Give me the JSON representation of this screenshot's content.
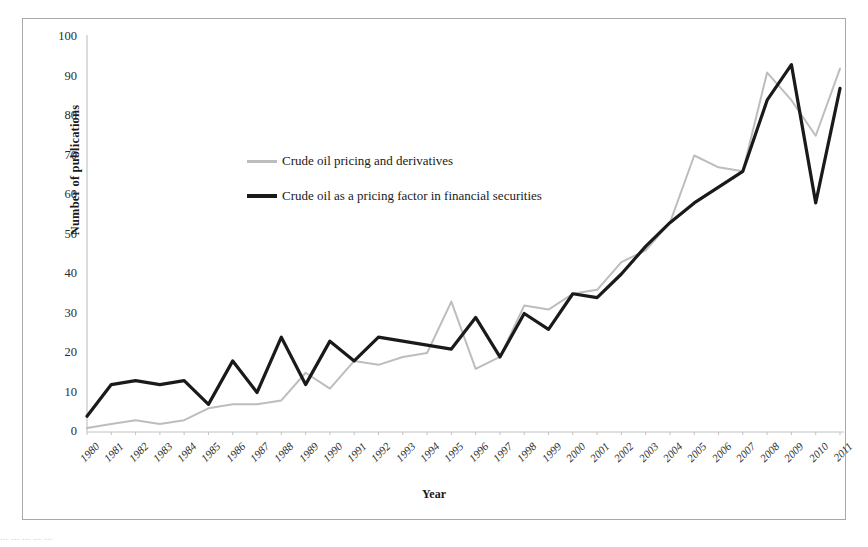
{
  "figure": {
    "y_axis_title": "Number of publications",
    "x_axis_title": "Year",
    "caption_partial": "... ... ... ... ..."
  },
  "legend": {
    "position": "inside-upper-left",
    "entries": [
      {
        "label": "Crude oil pricing and derivatives",
        "color": "#bdbdbd",
        "style": "thin-gray"
      },
      {
        "label": "Crude oil as a pricing factor in financial securities",
        "color": "#1a1a1a",
        "style": "thick-black"
      }
    ]
  },
  "chart_data": {
    "type": "line",
    "title": "",
    "xlabel": "Year",
    "ylabel": "Number of publications",
    "xlim": [
      1980,
      2011
    ],
    "ylim": [
      0,
      100
    ],
    "ytick_step": 10,
    "grid": false,
    "yticks": [
      0,
      10,
      20,
      30,
      40,
      50,
      60,
      70,
      80,
      90,
      100
    ],
    "categories": [
      "1980",
      "1981",
      "1982",
      "1983",
      "1984",
      "1985",
      "1986",
      "1987",
      "1988",
      "1989",
      "1990",
      "1991",
      "1992",
      "1993",
      "1994",
      "1995",
      "1996",
      "1997",
      "1998",
      "1999",
      "2000",
      "2001",
      "2002",
      "2003",
      "2004",
      "2005",
      "2006",
      "2007",
      "2008",
      "2009",
      "2010",
      "2011"
    ],
    "series": [
      {
        "name": "Crude oil pricing and derivatives",
        "color": "#bdbdbd",
        "values": [
          1,
          2,
          3,
          2,
          3,
          6,
          7,
          7,
          8,
          15,
          11,
          18,
          17,
          19,
          20,
          33,
          16,
          19,
          32,
          31,
          35,
          36,
          43,
          46,
          53,
          70,
          67,
          66,
          91,
          84,
          75,
          92
        ]
      },
      {
        "name": "Crude oil as a pricing factor in financial securities",
        "color": "#1a1a1a",
        "values": [
          4,
          12,
          13,
          12,
          13,
          7,
          18,
          10,
          24,
          12,
          23,
          18,
          24,
          23,
          22,
          21,
          29,
          19,
          30,
          26,
          35,
          34,
          40,
          47,
          53,
          58,
          62,
          66,
          84,
          93,
          58,
          87
        ]
      }
    ],
    "legend_entries": [
      "Crude oil pricing and derivatives",
      "Crude oil as a pricing factor in financial securities"
    ]
  }
}
